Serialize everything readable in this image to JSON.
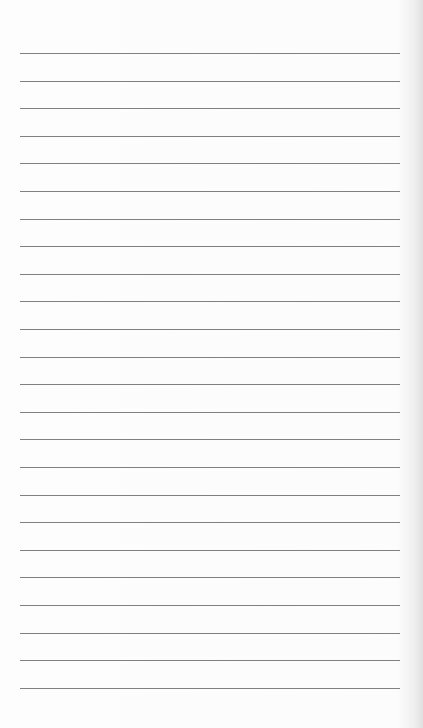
{
  "page": {
    "type": "lined-paper",
    "background_color": "#fcfcfc",
    "line_color": "#6a6a6a",
    "line_count": 24,
    "first_line_y": 53,
    "line_spacing": 27.6,
    "line_left": 20,
    "line_right": 400
  }
}
